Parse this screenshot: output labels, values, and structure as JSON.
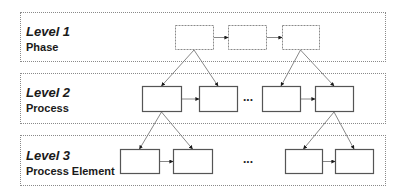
{
  "levels": [
    {
      "title": "Level 1",
      "subtitle": "Phase"
    },
    {
      "title": "Level 2",
      "subtitle": "Process"
    },
    {
      "title": "Level 3",
      "subtitle": "Process Element"
    }
  ],
  "ellipsis": {
    "level2": "...",
    "level3": "..."
  },
  "nodes": {
    "level1": [
      {
        "id": "phase-1",
        "x": 175,
        "y": 25,
        "w": 38,
        "h": 24,
        "style": "dashed"
      },
      {
        "id": "phase-2",
        "x": 228,
        "y": 25,
        "w": 38,
        "h": 24,
        "style": "dashed"
      },
      {
        "id": "phase-3",
        "x": 282,
        "y": 25,
        "w": 37,
        "h": 24,
        "style": "dashed"
      }
    ],
    "level2": [
      {
        "id": "process-1",
        "x": 142,
        "y": 86,
        "w": 39,
        "h": 25,
        "style": "solid"
      },
      {
        "id": "process-2",
        "x": 199,
        "y": 86,
        "w": 38,
        "h": 25,
        "style": "solid"
      },
      {
        "id": "process-3",
        "x": 262,
        "y": 86,
        "w": 38,
        "h": 25,
        "style": "solid"
      },
      {
        "id": "process-4",
        "x": 315,
        "y": 86,
        "w": 38,
        "h": 25,
        "style": "solid"
      }
    ],
    "level3": [
      {
        "id": "element-1",
        "x": 120,
        "y": 149,
        "w": 39,
        "h": 24,
        "style": "solid"
      },
      {
        "id": "element-2",
        "x": 173,
        "y": 149,
        "w": 39,
        "h": 24,
        "style": "solid"
      },
      {
        "id": "element-3",
        "x": 285,
        "y": 149,
        "w": 37,
        "h": 24,
        "style": "solid"
      },
      {
        "id": "element-4",
        "x": 335,
        "y": 149,
        "w": 38,
        "h": 24,
        "style": "solid"
      }
    ]
  },
  "edges": [
    {
      "from": "phase-1",
      "to": "phase-2",
      "type": "sequence"
    },
    {
      "from": "phase-2",
      "to": "phase-3",
      "type": "sequence"
    },
    {
      "from": "process-1",
      "to": "process-2",
      "type": "sequence"
    },
    {
      "from": "process-3",
      "to": "process-4",
      "type": "sequence"
    },
    {
      "from": "element-1",
      "to": "element-2",
      "type": "sequence"
    },
    {
      "from": "element-3",
      "to": "element-4",
      "type": "sequence"
    },
    {
      "from": "phase-1",
      "to": "process-1",
      "type": "decomposition"
    },
    {
      "from": "phase-1",
      "to": "process-2",
      "type": "decomposition"
    },
    {
      "from": "phase-3",
      "to": "process-3",
      "type": "decomposition"
    },
    {
      "from": "phase-3",
      "to": "process-4",
      "type": "decomposition"
    },
    {
      "from": "process-1",
      "to": "element-1",
      "type": "decomposition"
    },
    {
      "from": "process-1",
      "to": "element-2",
      "type": "decomposition"
    },
    {
      "from": "process-4",
      "to": "element-3",
      "type": "decomposition"
    },
    {
      "from": "process-4",
      "to": "element-4",
      "type": "decomposition"
    }
  ],
  "colors": {
    "frame": "#8a8a8a",
    "node": "#555555",
    "edge": "#6a6a6a",
    "arrowhead": "#1a1a1a"
  }
}
